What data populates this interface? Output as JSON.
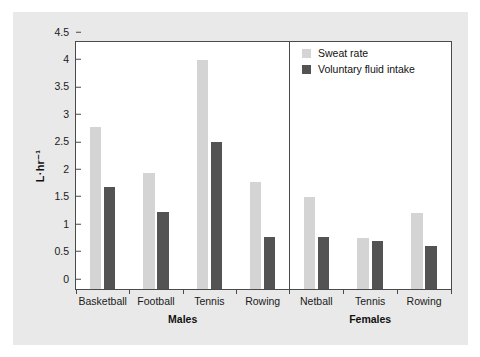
{
  "chart_data": {
    "type": "bar",
    "title": "",
    "xlabel": "",
    "ylabel": "L·hr⁻¹",
    "ylim": [
      0,
      4.5
    ],
    "ytick_step": 0.5,
    "yticks": [
      "0",
      "0.5",
      "1",
      "1.5",
      "2",
      "2.5",
      "3",
      "3.5",
      "4",
      "4.5"
    ],
    "grid": false,
    "legend_position": "top-right-inside",
    "colors": {
      "sweat_rate": "#d4d4d4",
      "voluntary_fluid_intake": "#535353",
      "axis": "#4a4a4a",
      "panel_background": "#e9e9e9",
      "plot_background": "#ffffff",
      "text": "#1a1a1a"
    },
    "legend": [
      {
        "label": "Sweat rate",
        "color": "#d4d4d4"
      },
      {
        "label": "Voluntary fluid intake",
        "color": "#535353"
      }
    ],
    "series": [
      {
        "name": "Sweat rate",
        "values": [
          2.95,
          2.12,
          4.17,
          1.95,
          1.68,
          0.93,
          1.38
        ]
      },
      {
        "name": "Voluntary fluid intake",
        "values": [
          1.86,
          1.41,
          2.68,
          0.95,
          0.95,
          0.88,
          0.78
        ]
      }
    ],
    "categories": [
      "Basketball",
      "Football",
      "Tennis",
      "Rowing",
      "Netball",
      "Tennis",
      "Rowing"
    ],
    "groups": [
      {
        "label": "Males",
        "categories": [
          "Basketball",
          "Football",
          "Tennis",
          "Rowing"
        ]
      },
      {
        "label": "Females",
        "categories": [
          "Netball",
          "Tennis",
          "Rowing"
        ]
      }
    ]
  }
}
